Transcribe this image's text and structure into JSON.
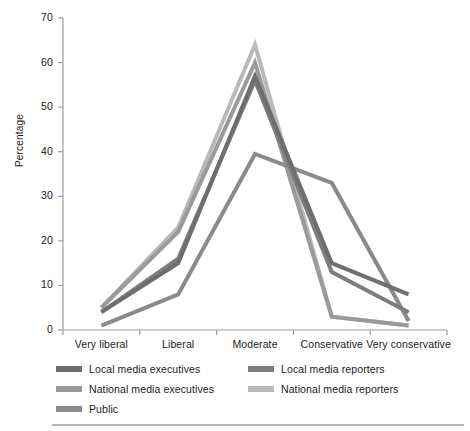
{
  "chart_data": {
    "type": "line",
    "title": "",
    "subtitle": "",
    "xlabel": "",
    "ylabel": "Percentage",
    "categories": [
      "Very liberal",
      "Liberal",
      "Moderate",
      "Conservative",
      "Very conservative"
    ],
    "ylim": [
      0,
      70
    ],
    "yticks": [
      0,
      10,
      20,
      30,
      40,
      50,
      60,
      70
    ],
    "ytick_labels": [
      "0",
      "10",
      "20",
      "30",
      "40",
      "50",
      "60",
      "70"
    ],
    "grid": false,
    "legend_position": "bottom",
    "series": [
      {
        "name": "Local media executives",
        "color": "#6e6e6e",
        "values": [
          4,
          15,
          57,
          15,
          8
        ]
      },
      {
        "name": "Local media reporters",
        "color": "#7d7d7d",
        "values": [
          4,
          16,
          56,
          13,
          4
        ]
      },
      {
        "name": "National media executives",
        "color": "#9a9a9a",
        "values": [
          5,
          22,
          60,
          3,
          1
        ]
      },
      {
        "name": "National media reporters",
        "color": "#b9b9b9",
        "values": [
          5,
          23,
          64,
          3,
          1
        ]
      },
      {
        "name": "Public",
        "color": "#8a8a8a",
        "values": [
          1,
          8,
          39.5,
          33,
          2
        ]
      }
    ]
  },
  "axis": {
    "y_title": "Percentage"
  },
  "legend": {
    "items": [
      {
        "label": "Local media executives",
        "color": "#6e6e6e"
      },
      {
        "label": "Local media reporters",
        "color": "#7d7d7d"
      },
      {
        "label": "National media executives",
        "color": "#9a9a9a"
      },
      {
        "label": "National media reporters",
        "color": "#b9b9b9"
      },
      {
        "label": "Public",
        "color": "#8a8a8a"
      }
    ]
  },
  "style": {
    "axis_color": "#9d9d9d",
    "text_color": "#1a1a1a",
    "background": "#ffffff",
    "line_width": 4
  }
}
